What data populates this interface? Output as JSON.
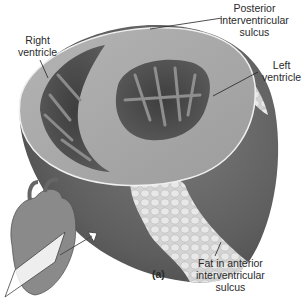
{
  "figure": {
    "panel_label": "(a)",
    "labels": {
      "right_ventricle": [
        "Right",
        "ventricle"
      ],
      "posterior_sulcus": [
        "Posterior",
        "interventricular",
        "sulcus"
      ],
      "left_ventricle": [
        "Left",
        "ventricle"
      ],
      "anterior_fat": [
        "Fat in anterior",
        "interventricular",
        "sulcus"
      ]
    },
    "colors": {
      "background": "#ffffff",
      "muscle_outer": "#6b6b6b",
      "muscle_cut_surface": "#a8a8a8",
      "chamber_dark": "#4a4a4a",
      "fat": "#d9d9d9",
      "label_text": "#2a2a2a",
      "leader_line": "#222222"
    }
  }
}
